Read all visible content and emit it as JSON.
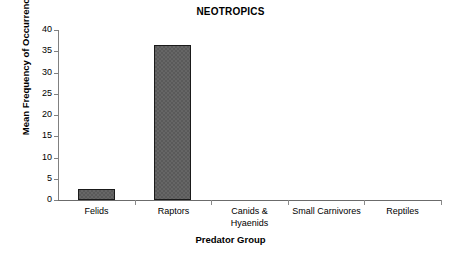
{
  "chart_data": {
    "type": "bar",
    "title": "NEOTROPICS",
    "xlabel": "Predator Group",
    "ylabel": "Mean Frequency of Occurrence (%)",
    "categories": [
      "Felids",
      "Raptors",
      "Canids &\nHyaenids",
      "Small Carnivores",
      "Reptiles"
    ],
    "values": [
      2.6,
      36.4,
      0,
      0,
      0
    ],
    "ylim": [
      0,
      40
    ],
    "yticks": [
      0,
      5,
      10,
      15,
      20,
      25,
      30,
      35,
      40
    ],
    "ytick_labels": [
      "0",
      "5",
      "10",
      "15",
      "20",
      "25",
      "30",
      "35",
      "40"
    ],
    "grid": false,
    "legend": false,
    "bar_color": "#5a5a5a",
    "bar_edge_color": "#1a1a1a",
    "axis_color": "#808080",
    "background_color": "#ffffff"
  }
}
